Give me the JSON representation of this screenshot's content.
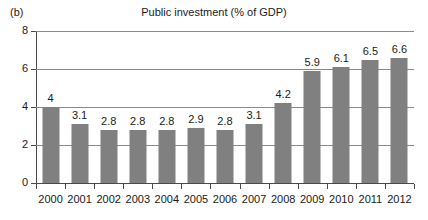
{
  "figure": {
    "panel_label": "(b)",
    "title": "Public investment (% of GDP)"
  },
  "colors": {
    "bar_fill": "#808080",
    "gridline": "#8a8a8a",
    "axis": "#4a4a4a",
    "text": "#1a1a1a",
    "background": "#ffffff"
  },
  "chart_data": {
    "type": "bar",
    "title": "Public investment (% of GDP)",
    "subtitle": "(b)",
    "xlabel": "",
    "ylabel": "",
    "categories": [
      "2000",
      "2001",
      "2002",
      "2003",
      "2004",
      "2005",
      "2006",
      "2007",
      "2008",
      "2009",
      "2010",
      "2011",
      "2012"
    ],
    "values": [
      4,
      3.1,
      2.8,
      2.8,
      2.8,
      2.9,
      2.8,
      3.1,
      4.2,
      5.9,
      6.1,
      6.5,
      6.6
    ],
    "data_labels": [
      "4",
      "3.1",
      "2.8",
      "2.8",
      "2.8",
      "2.9",
      "2.8",
      "3.1",
      "4.2",
      "5.9",
      "6.1",
      "6.5",
      "6.6"
    ],
    "ylim": [
      0,
      8
    ],
    "yticks": [
      0,
      2,
      4,
      6,
      8
    ],
    "ytick_labels": [
      "0",
      "2",
      "4",
      "6",
      "8"
    ],
    "grid": true,
    "grid_axis": "y",
    "legend": false,
    "legend_position": "none",
    "series_color": "#808080"
  }
}
